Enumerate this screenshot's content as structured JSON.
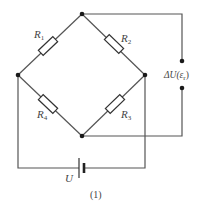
{
  "diagram": {
    "type": "wheatstone-bridge-circuit",
    "caption": "(1)",
    "resistors": [
      {
        "id": "R1",
        "label": "R",
        "subscript": "1",
        "branch": "left-top"
      },
      {
        "id": "R2",
        "label": "R",
        "subscript": "2",
        "branch": "top-right"
      },
      {
        "id": "R3",
        "label": "R",
        "subscript": "3",
        "branch": "right-bottom"
      },
      {
        "id": "R4",
        "label": "R",
        "subscript": "4",
        "branch": "left-bottom"
      }
    ],
    "source": {
      "label": "U",
      "type": "battery"
    },
    "output": {
      "label": "ΔU(ε",
      "subscript": "r",
      "suffix": ")"
    },
    "nodes": [
      "top",
      "left",
      "right",
      "bottom"
    ],
    "colors": {
      "wire": "#555555",
      "node": "#1a1a1a",
      "text": "#444444"
    }
  }
}
